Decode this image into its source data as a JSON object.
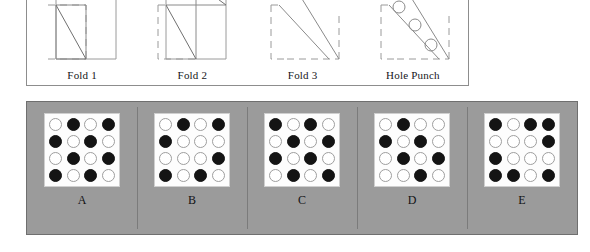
{
  "stimulus": {
    "panel_name": "paper-folding-sequence",
    "steps": [
      {
        "id": "fold-1",
        "label": "Fold 1",
        "art": "square-bottom-left-diagonal-fold",
        "description": "Square sheet with bottom-left quadrant folded up along its diagonal; dashed outline marks original position."
      },
      {
        "id": "fold-2",
        "label": "Fold 2",
        "art": "square-bottom-half-diagonal-fold",
        "description": "Bottom-left half folded up to the top-right along the diagonal; dashed outline marks original position."
      },
      {
        "id": "fold-3",
        "label": "Fold 3",
        "art": "triangle-diagonal-fold",
        "description": "Remaining shape folded once more into a triangle; dashed outline marks original position."
      },
      {
        "id": "hole-punch",
        "label": "Hole Punch",
        "art": "triangle-with-three-holes",
        "description": "Three holes punched in a diagonal line through the folded triangle.",
        "hole_count": 3
      }
    ]
  },
  "options": {
    "panel_name": "answer-choices",
    "grid_rows": 4,
    "grid_cols": 4,
    "legend": {
      "filled": "punched hole",
      "empty": "no hole"
    },
    "items": [
      {
        "label": "A",
        "pattern": [
          [
            "empty",
            "filled",
            "empty",
            "filled"
          ],
          [
            "filled",
            "empty",
            "filled",
            "empty"
          ],
          [
            "empty",
            "filled",
            "empty",
            "filled"
          ],
          [
            "filled",
            "empty",
            "filled",
            "empty"
          ]
        ]
      },
      {
        "label": "B",
        "pattern": [
          [
            "empty",
            "filled",
            "empty",
            "filled"
          ],
          [
            "filled",
            "empty",
            "empty",
            "empty"
          ],
          [
            "empty",
            "empty",
            "empty",
            "filled"
          ],
          [
            "filled",
            "empty",
            "filled",
            "empty"
          ]
        ]
      },
      {
        "label": "C",
        "pattern": [
          [
            "filled",
            "empty",
            "filled",
            "empty"
          ],
          [
            "empty",
            "filled",
            "empty",
            "filled"
          ],
          [
            "filled",
            "empty",
            "filled",
            "empty"
          ],
          [
            "empty",
            "filled",
            "empty",
            "filled"
          ]
        ]
      },
      {
        "label": "D",
        "pattern": [
          [
            "empty",
            "filled",
            "empty",
            "empty"
          ],
          [
            "filled",
            "empty",
            "filled",
            "empty"
          ],
          [
            "empty",
            "filled",
            "empty",
            "filled"
          ],
          [
            "empty",
            "empty",
            "filled",
            "empty"
          ]
        ]
      },
      {
        "label": "E",
        "pattern": [
          [
            "filled",
            "empty",
            "filled",
            "filled"
          ],
          [
            "empty",
            "empty",
            "empty",
            "filled"
          ],
          [
            "filled",
            "empty",
            "empty",
            "empty"
          ],
          [
            "filled",
            "filled",
            "empty",
            "filled"
          ]
        ]
      }
    ]
  },
  "colors": {
    "options_panel_background": "#9b9b9b",
    "grid_background": "#fdfdfd",
    "filled_dot": "#141414",
    "empty_dot_border": "#9e9e9e",
    "line": "#8d8d8d",
    "text": "#16161a"
  }
}
